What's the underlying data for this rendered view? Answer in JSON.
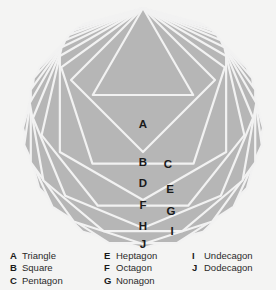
{
  "figure": {
    "type": "nested-regular-polygons-diagram",
    "background_color": "#f4f4f3",
    "fill_color": "#b6b6b6",
    "outline_color": "#f2f2f2",
    "label_color": "#1a1a1a",
    "polygons": [
      {
        "key": "A",
        "name": "Triangle",
        "sides": 3,
        "label_x": 143,
        "label_y": 125
      },
      {
        "key": "B",
        "name": "Square",
        "sides": 4,
        "label_x": 143,
        "label_y": 163
      },
      {
        "key": "C",
        "name": "Pentagon",
        "sides": 5,
        "label_x": 168,
        "label_y": 165
      },
      {
        "key": "D",
        "name": "Hexagon",
        "sides": 6,
        "label_x": 143,
        "label_y": 184
      },
      {
        "key": "E",
        "name": "Heptagon",
        "sides": 7,
        "label_x": 170,
        "label_y": 190
      },
      {
        "key": "F",
        "name": "Octagon",
        "sides": 8,
        "label_x": 143,
        "label_y": 206
      },
      {
        "key": "G",
        "name": "Nonagon",
        "sides": 9,
        "label_x": 171,
        "label_y": 212
      },
      {
        "key": "H",
        "name": "Decagon",
        "sides": 10,
        "label_x": 143,
        "label_y": 227
      },
      {
        "key": "I",
        "name": "Undecagon",
        "sides": 11,
        "label_x": 172,
        "label_y": 232
      },
      {
        "key": "J",
        "name": "Dodecagon",
        "sides": 12,
        "label_x": 143,
        "label_y": 245
      }
    ]
  },
  "legend": {
    "columns": [
      {
        "items": [
          {
            "key": "A",
            "name": "Triangle"
          },
          {
            "key": "B",
            "name": "Square"
          },
          {
            "key": "C",
            "name": "Pentagon"
          }
        ]
      },
      {
        "items": [
          {
            "key": "E",
            "name": "Heptagon"
          },
          {
            "key": "F",
            "name": "Octagon"
          },
          {
            "key": "G",
            "name": "Nonagon"
          }
        ]
      },
      {
        "items": [
          {
            "key": "I",
            "name": "Undecagon"
          },
          {
            "key": "J",
            "name": "Dodecagon"
          }
        ]
      }
    ]
  }
}
